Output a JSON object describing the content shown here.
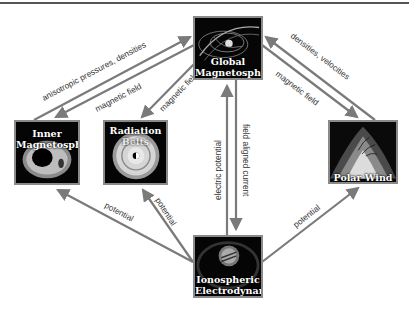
{
  "diagram": {
    "nodes": [
      {
        "id": "global",
        "label_lines": [
          "Global",
          "Magnetosphere"
        ]
      },
      {
        "id": "inner",
        "label_lines": [
          "Inner",
          "Magnetosphere"
        ]
      },
      {
        "id": "radiation",
        "label_lines": [
          "Radiation",
          "Belts"
        ]
      },
      {
        "id": "polar",
        "label_lines": [
          "Polar Wind"
        ]
      },
      {
        "id": "iono",
        "label_lines": [
          "Ionospheric",
          "Electrodynamics"
        ]
      }
    ],
    "edges": [
      {
        "from": "inner",
        "to": "global",
        "label": "anisotropic pressures, densities"
      },
      {
        "from": "global",
        "to": "inner",
        "label": "magnetic field"
      },
      {
        "from": "global",
        "to": "radiation",
        "label": "magnetic field"
      },
      {
        "from": "polar",
        "to": "global",
        "label": "densities, velocities"
      },
      {
        "from": "global",
        "to": "polar",
        "label": "magnetic field"
      },
      {
        "from": "iono",
        "to": "global",
        "label": "electric potential"
      },
      {
        "from": "global",
        "to": "iono",
        "label": "field aligned current"
      },
      {
        "from": "iono",
        "to": "inner",
        "label": "potential"
      },
      {
        "from": "iono",
        "to": "radiation",
        "label": "potential"
      },
      {
        "from": "iono",
        "to": "polar",
        "label": "potential"
      }
    ]
  },
  "colors": {
    "arrow": "#7a7a7a",
    "node_border": "#8a8a8a",
    "node_fill": "#050505",
    "label_text": "#333333"
  }
}
